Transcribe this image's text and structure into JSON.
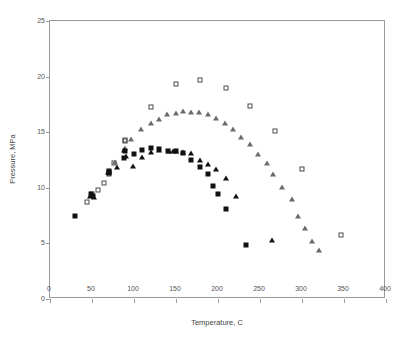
{
  "chart_data": {
    "type": "scatter",
    "title": "",
    "xlabel": "Temperature, C",
    "ylabel": "Pressure, MPa",
    "xlim": [
      0,
      400
    ],
    "ylim": [
      0,
      25
    ],
    "xticks": [
      0,
      50,
      100,
      150,
      200,
      250,
      300,
      350,
      400
    ],
    "yticks": [
      0,
      5,
      10,
      15,
      20,
      25
    ],
    "grid": false,
    "legend": "none",
    "series": [
      {
        "name": "open-square",
        "marker": "open-square",
        "color": "#4a4a4a",
        "points": [
          [
            44,
            8.7
          ],
          [
            50,
            9.4
          ],
          [
            57,
            9.8
          ],
          [
            64,
            10.4
          ],
          [
            70,
            11.4
          ],
          [
            70,
            11.2
          ],
          [
            76,
            12.2
          ],
          [
            89,
            14.3
          ],
          [
            89,
            14.2
          ],
          [
            120,
            17.3
          ],
          [
            150,
            19.3
          ],
          [
            178,
            19.7
          ],
          [
            209,
            19.0
          ],
          [
            238,
            17.4
          ],
          [
            268,
            15.1
          ],
          [
            300,
            11.7
          ],
          [
            347,
            5.8
          ]
        ]
      },
      {
        "name": "open-triangle",
        "marker": "open-triangle",
        "color": "#6b6b6b",
        "points": [
          [
            78,
            12.3
          ],
          [
            89,
            13.6
          ],
          [
            97,
            14.4
          ],
          [
            108,
            15.3
          ],
          [
            120,
            15.8
          ],
          [
            130,
            16.2
          ],
          [
            140,
            16.6
          ],
          [
            150,
            16.7
          ],
          [
            158,
            16.9
          ],
          [
            168,
            16.8
          ],
          [
            178,
            16.8
          ],
          [
            188,
            16.6
          ],
          [
            198,
            16.3
          ],
          [
            208,
            15.8
          ],
          [
            218,
            15.3
          ],
          [
            228,
            14.6
          ],
          [
            238,
            13.9
          ],
          [
            248,
            13.0
          ],
          [
            258,
            12.2
          ],
          [
            266,
            11.2
          ],
          [
            276,
            10.1
          ],
          [
            288,
            9.0
          ],
          [
            296,
            7.5
          ],
          [
            304,
            6.4
          ],
          [
            312,
            5.2
          ],
          [
            321,
            4.4
          ]
        ]
      },
      {
        "name": "filled-square",
        "marker": "filled-square",
        "color": "#111111",
        "points": [
          [
            30,
            7.5
          ],
          [
            49,
            9.4
          ],
          [
            51,
            9.3
          ],
          [
            70,
            11.5
          ],
          [
            70,
            11.3
          ],
          [
            88,
            12.7
          ],
          [
            89,
            13.3
          ],
          [
            100,
            13.0
          ],
          [
            110,
            13.4
          ],
          [
            120,
            13.6
          ],
          [
            130,
            13.5
          ],
          [
            140,
            13.3
          ],
          [
            150,
            13.3
          ],
          [
            158,
            13.1
          ],
          [
            168,
            12.5
          ],
          [
            178,
            11.9
          ],
          [
            188,
            11.2
          ],
          [
            194,
            10.2
          ],
          [
            200,
            9.4
          ],
          [
            210,
            8.1
          ],
          [
            233,
            4.9
          ]
        ]
      },
      {
        "name": "filled-triangle",
        "marker": "filled-triangle",
        "color": "#111111",
        "points": [
          [
            48,
            9.3
          ],
          [
            52,
            9.2
          ],
          [
            69,
            11.4
          ],
          [
            80,
            11.9
          ],
          [
            88,
            13.4
          ],
          [
            90,
            12.9
          ],
          [
            99,
            12.0
          ],
          [
            110,
            12.8
          ],
          [
            120,
            13.2
          ],
          [
            130,
            13.4
          ],
          [
            142,
            13.3
          ],
          [
            146,
            13.3
          ],
          [
            150,
            13.3
          ],
          [
            158,
            13.2
          ],
          [
            168,
            13.1
          ],
          [
            178,
            12.5
          ],
          [
            188,
            12.1
          ],
          [
            198,
            11.7
          ],
          [
            209,
            10.9
          ],
          [
            222,
            9.3
          ],
          [
            264,
            5.3
          ]
        ]
      }
    ]
  }
}
